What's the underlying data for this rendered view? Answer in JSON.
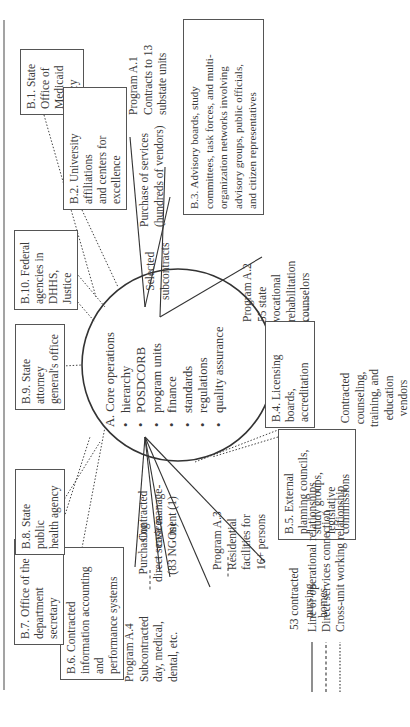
{
  "diagram": {
    "orientation": "rotated-90-ccw",
    "core": {
      "title": "A. Core operations",
      "items": [
        "hierarchy",
        "POSDCORB",
        "program units",
        "finance",
        "standards",
        "regulations",
        "quality assurance"
      ]
    },
    "b_boxes": {
      "b1": [
        "B.1. State Office of",
        "Medicaid Policy"
      ],
      "b2": [
        "B.2. University affiliations",
        "and centers for excellence"
      ],
      "b3": [
        "B.3. Advisory boards, study",
        "committees, task forces, and multi-",
        "organization networks involving",
        "advisory groups, public officials,",
        "and citizen representatives"
      ],
      "b4": [
        "B.4. Licensing",
        "boards, accreditation"
      ],
      "b5": [
        "B.5. External",
        "planning councils,",
        "study groups,",
        "legislative",
        "commissions"
      ],
      "b6": [
        "B.6. Contracted",
        "information accounting and",
        "performance systems"
      ],
      "b7": [
        "B.7. Office of the",
        "department secretary"
      ],
      "b8": [
        "B.8. State public",
        "health agency"
      ],
      "b9": [
        "B.9. State attorney",
        "general's office"
      ],
      "b10": [
        "B.10. Federal",
        "agencies in",
        "DHHS, Justice"
      ]
    },
    "programs": {
      "a1": [
        "Program A.1",
        "Contracts to 13",
        "substate units"
      ],
      "a1_purchase": [
        "Purchase of services",
        "(hundreds of vendors)"
      ],
      "a1_selected": [
        "Selected",
        "subcontracts"
      ],
      "a2": [
        "Program A.2",
        "55 state",
        "vocational",
        "rehabilitation",
        "counselors"
      ],
      "a2_vendors": [
        "Contracted",
        "counseling,",
        "training, and",
        "education",
        "vendors"
      ],
      "a3": [
        "Program A.3",
        "Residential",
        "facilities for",
        "16+ persons"
      ],
      "a3_homes": [
        "53 contracted",
        "nursing",
        "homes"
      ],
      "a4": [
        "Program A.4",
        "Subcontracted",
        "day, medical,",
        "dental, etc."
      ],
      "a4_purchasing": [
        "Purchasing",
        "direct services",
        "(83 NGOs)"
      ],
      "case_mgmt": [
        "Contracted",
        "case manage-",
        "ment (1)"
      ]
    },
    "legend": [
      {
        "style": "solid",
        "label": "Line or operational relationships"
      },
      {
        "style": "dashed",
        "label": "Direct services connection"
      },
      {
        "style": "dotted",
        "label": "Cross-unit working relationship"
      }
    ],
    "colors": {
      "line": "#444444",
      "text": "#3a3a3a",
      "box_border": "#555555"
    }
  }
}
